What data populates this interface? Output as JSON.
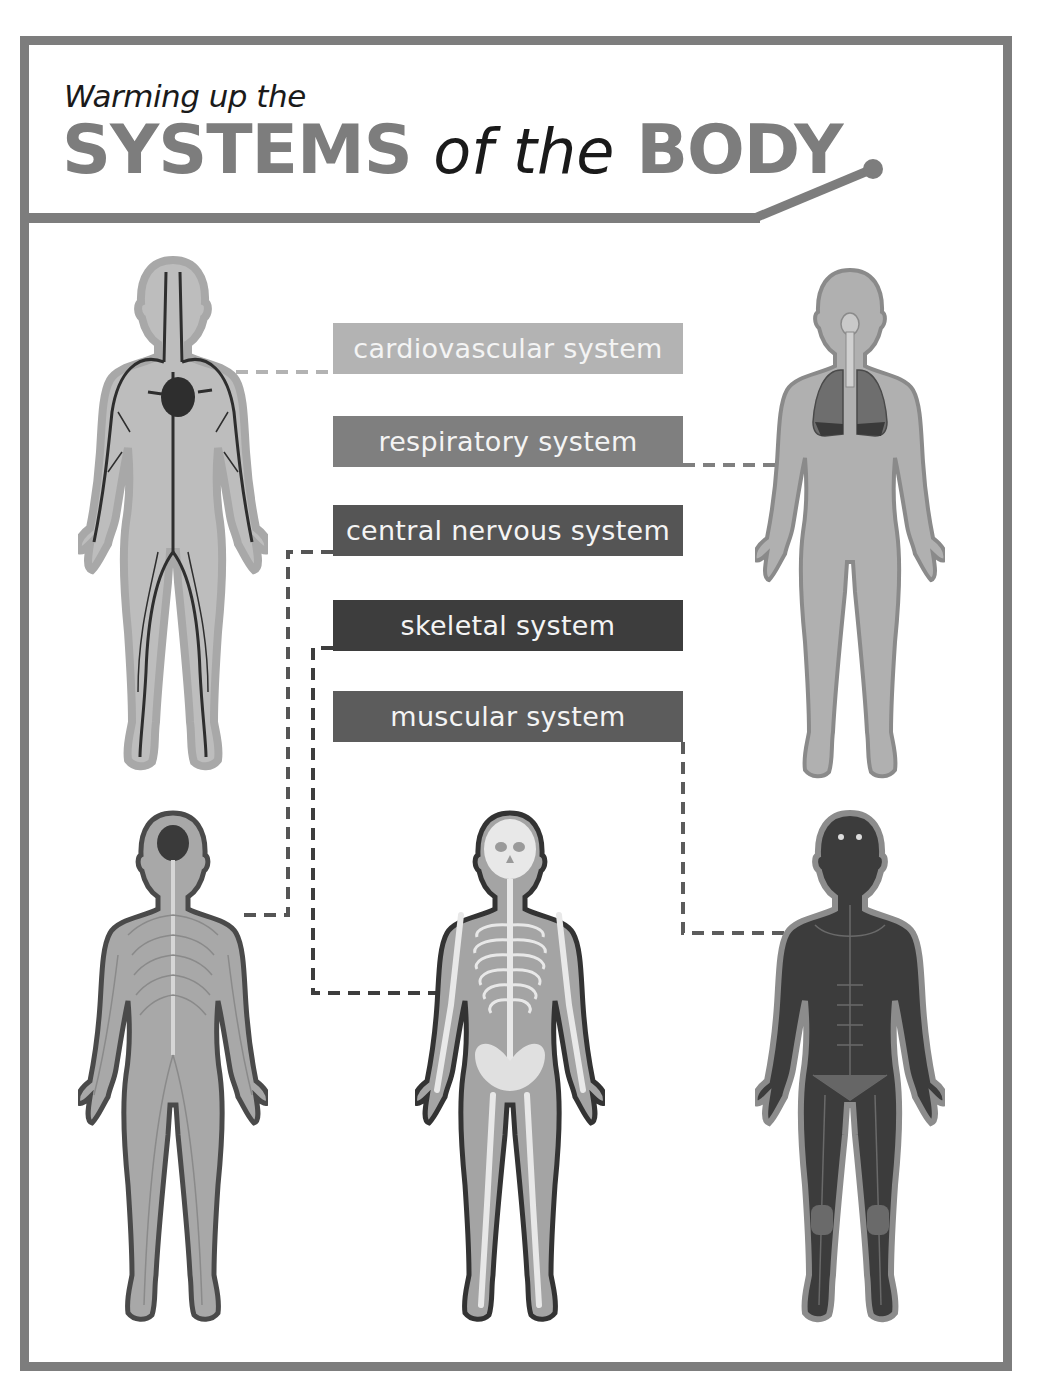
{
  "header": {
    "subtitle": "Warming up the",
    "title_part1": "SYSTEMS",
    "title_part2": "of the",
    "title_part3": "BODY"
  },
  "labels": [
    {
      "id": "cardiovascular",
      "text": "cardiovascular system",
      "color": "#b3b3b3",
      "top": 323
    },
    {
      "id": "respiratory",
      "text": "respiratory system",
      "color": "#7f7f7f",
      "top": 416
    },
    {
      "id": "central-nervous",
      "text": "central nervous system",
      "color": "#555555",
      "top": 505
    },
    {
      "id": "skeletal",
      "text": "skeletal system",
      "color": "#3d3d3d",
      "top": 600
    },
    {
      "id": "muscular",
      "text": "muscular system",
      "color": "#5c5c5c",
      "top": 691
    }
  ],
  "figures": [
    {
      "id": "cardiovascular-figure",
      "system": "cardiovascular system",
      "position": "top-left"
    },
    {
      "id": "respiratory-figure",
      "system": "respiratory system",
      "position": "top-right"
    },
    {
      "id": "nervous-figure",
      "system": "central nervous system",
      "position": "bottom-left"
    },
    {
      "id": "skeletal-figure",
      "system": "skeletal system",
      "position": "bottom-center"
    },
    {
      "id": "muscular-figure",
      "system": "muscular system",
      "position": "bottom-right"
    }
  ],
  "colors": {
    "frame": "#7d7d7d",
    "title": "#7d7d7d",
    "text_dark": "#1a1a1a",
    "label_text": "#f4f4f4"
  }
}
